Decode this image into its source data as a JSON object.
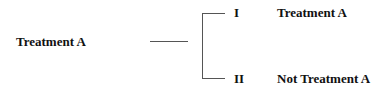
{
  "diagram": {
    "root": "Treatment A",
    "branches": [
      {
        "numeral": "I",
        "label": "Treatment A"
      },
      {
        "numeral": "II",
        "label": "Not Treatment A"
      }
    ]
  }
}
